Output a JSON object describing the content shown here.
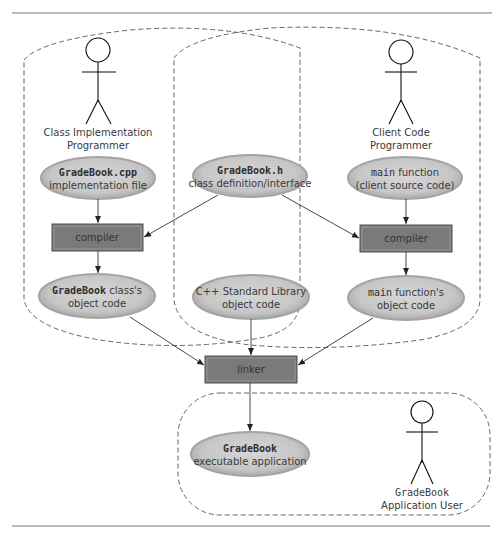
{
  "diagram": {
    "actors": [
      {
        "id": "class-impl-programmer",
        "line1": "Class Implementation",
        "line2": "Programmer"
      },
      {
        "id": "client-code-programmer",
        "line1": "Client Code",
        "line2": "Programmer"
      },
      {
        "id": "app-user",
        "line1": "GradeBook",
        "line2": "Application User"
      }
    ],
    "nodes": {
      "gradebook_cpp": {
        "code": "GradeBook.cpp",
        "text": "implementation file"
      },
      "gradebook_h": {
        "code": "GradeBook.h",
        "text": "class definition/interface"
      },
      "main_function": {
        "code": "main",
        "text1": " function",
        "text2": "(client source code)"
      },
      "compiler_left": {
        "label": "compiler"
      },
      "compiler_right": {
        "label": "compiler"
      },
      "gradebook_obj": {
        "code": "GradeBook",
        "text1": " class's",
        "text2": "object code"
      },
      "stdlib_obj": {
        "text1": "C++ Standard Library",
        "text2": "object code"
      },
      "main_obj": {
        "code": "main",
        "text1": " function's",
        "text2": "object code"
      },
      "linker": {
        "label": "linker"
      },
      "executable": {
        "code": "GradeBook",
        "text": "executable application"
      }
    },
    "colors": {
      "ellipse_fill": "#c8c8c8",
      "ellipse_rim": "#a8a8a8",
      "box_fill": "#7a7a7a",
      "box_bevel_light": "#9a9a9a",
      "box_bevel_dark": "#555555",
      "rule": "#777777"
    }
  }
}
